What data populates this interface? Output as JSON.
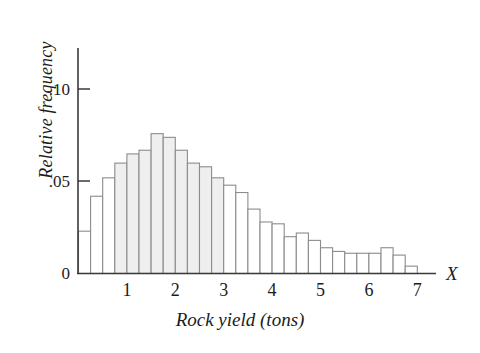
{
  "chart_data": {
    "type": "bar",
    "title": "",
    "subtitle": "",
    "xlabel": "Rock yield (tons)",
    "ylabel": "Relative frequency",
    "axis_variable_label": "X",
    "xlim": [
      0,
      7.25
    ],
    "ylim": [
      0,
      0.115
    ],
    "xtick_labels": [
      "1",
      "2",
      "3",
      "4",
      "5",
      "6",
      "7"
    ],
    "xticks": [
      1,
      2,
      3,
      4,
      5,
      6,
      7
    ],
    "ytick_labels": [
      ".10",
      ".05",
      "0"
    ],
    "yticks": [
      0.1,
      0.05,
      0
    ],
    "grid": false,
    "legend": null,
    "bin_width": 0.25,
    "bin_left_edges": [
      0.0,
      0.25,
      0.5,
      0.75,
      1.0,
      1.25,
      1.5,
      1.75,
      2.0,
      2.25,
      2.5,
      2.75,
      3.0,
      3.25,
      3.5,
      3.75,
      4.0,
      4.25,
      4.5,
      4.75,
      5.0,
      5.25,
      5.5,
      5.75,
      6.0,
      6.25,
      6.5,
      6.75
    ],
    "categories": [
      "0.00-0.25",
      "0.25-0.50",
      "0.50-0.75",
      "0.75-1.00",
      "1.00-1.25",
      "1.25-1.50",
      "1.50-1.75",
      "1.75-2.00",
      "2.00-2.25",
      "2.25-2.50",
      "2.50-2.75",
      "2.75-3.00",
      "3.00-3.25",
      "3.25-3.50",
      "3.50-3.75",
      "3.75-4.00",
      "4.00-4.25",
      "4.25-4.50",
      "4.50-4.75",
      "4.75-5.00",
      "5.00-5.25",
      "5.25-5.50",
      "5.50-5.75",
      "5.75-6.00",
      "6.00-6.25",
      "6.25-6.50",
      "6.50-6.75",
      "6.75-7.00"
    ],
    "values": [
      0.023,
      0.042,
      0.052,
      0.06,
      0.065,
      0.067,
      0.076,
      0.074,
      0.067,
      0.06,
      0.058,
      0.052,
      0.048,
      0.044,
      0.035,
      0.028,
      0.027,
      0.02,
      0.022,
      0.018,
      0.014,
      0.012,
      0.011,
      0.011,
      0.011,
      0.014,
      0.01,
      0.004
    ]
  },
  "figure": {
    "x_axis_name": "X"
  }
}
